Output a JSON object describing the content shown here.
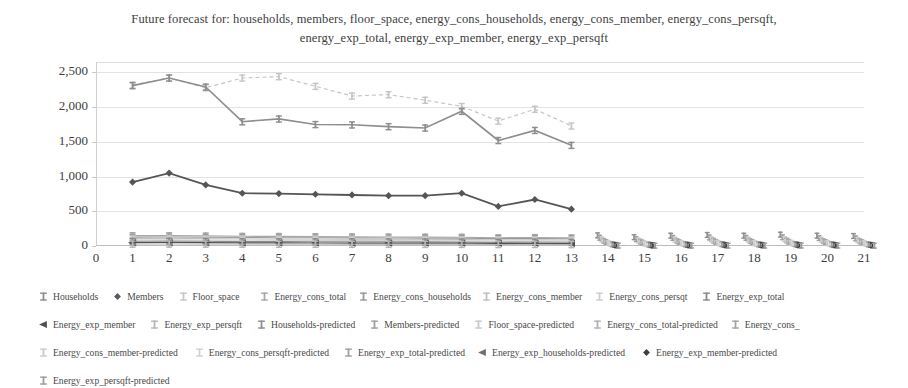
{
  "title": {
    "line1": "Future forecast for: households, members, floor_space, energy_cons_households, energy_cons_member, energy_cons_persqft,",
    "line2": "energy_exp_total, energy_exp_member, energy_exp_persqft"
  },
  "axes": {
    "y_ticks": [
      "0",
      "500",
      "1,000",
      "1,500",
      "2,000",
      "2,500"
    ],
    "x_ticks": [
      "0",
      "1",
      "2",
      "3",
      "4",
      "5",
      "6",
      "7",
      "8",
      "9",
      "10",
      "11",
      "12",
      "13",
      "14",
      "15",
      "16",
      "17",
      "18",
      "19",
      "20",
      "21"
    ]
  },
  "legend": {
    "rows": [
      [
        {
          "label": "Households",
          "marker": "marker-plus",
          "color": "#8e8e8e"
        },
        {
          "label": "Members",
          "marker": "marker-diamond",
          "color": "#5a5a5a"
        },
        {
          "label": "Floor_space",
          "marker": "marker-plus",
          "color": "#c6c6c6"
        },
        {
          "label": "Energy_cons_total",
          "marker": "marker-plus",
          "color": "#a8a8a8"
        },
        {
          "label": "Energy_cons_households",
          "marker": "marker-plus",
          "color": "#9a9a9a"
        },
        {
          "label": "Energy_cons_member",
          "marker": "marker-plus",
          "color": "#bfbfbf"
        },
        {
          "label": "Energy_cons_persqt",
          "marker": "marker-plus",
          "color": "#cfcfcf"
        },
        {
          "label": "Energy_exp_total",
          "marker": "marker-plus",
          "color": "#8a8a8a"
        }
      ],
      [
        {
          "label": "Energy_exp_member",
          "marker": "marker-triangle-left",
          "color": "#4f4f4f"
        },
        {
          "label": "Energy_exp_persqft",
          "marker": "marker-plus",
          "color": "#b5b5b5"
        },
        {
          "label": "Households-predicted",
          "marker": "marker-plus",
          "color": "#8e8e8e"
        },
        {
          "label": "Members-predicted",
          "marker": "marker-plus",
          "color": "#9e9e9e"
        },
        {
          "label": "Floor_space-predicted",
          "marker": "marker-plus",
          "color": "#c9c9c9"
        },
        {
          "label": "Energy_cons_total-predicted",
          "marker": "marker-plus",
          "color": "#b0b0b0"
        },
        {
          "label": "Energy_cons_",
          "marker": "marker-plus",
          "color": "#a4a4a4"
        }
      ],
      [
        {
          "label": "Energy_cons_member-predicted",
          "marker": "marker-plus",
          "color": "#cbcbcb"
        },
        {
          "label": "Energy_cons_persqft-predicted",
          "marker": "marker-plus",
          "color": "#d2d2d2"
        },
        {
          "label": "Energy_exp_total-predicted",
          "marker": "marker-plus",
          "color": "#a0a0a0"
        },
        {
          "label": "Energy_exp_households-predicted",
          "marker": "marker-triangle-left",
          "color": "#6e6e6e"
        },
        {
          "label": "Energy_exp_member-predicted",
          "marker": "marker-diamond",
          "color": "#3f3f3f"
        }
      ],
      [
        {
          "label": "Energy_exp_persqft-predicted",
          "marker": "marker-plus",
          "color": "#9c9c9c"
        }
      ]
    ]
  },
  "chart_data": {
    "type": "line",
    "title": "Future forecast for: households, members, floor_space, energy_cons_households, energy_cons_member, energy_cons_persqft, energy_exp_total, energy_exp_member, energy_exp_persqft",
    "xlabel": "",
    "ylabel": "",
    "xlim": [
      0,
      21
    ],
    "ylim": [
      0,
      2650
    ],
    "grid": true,
    "legend_position": "bottom",
    "x": [
      1,
      2,
      3,
      4,
      5,
      6,
      7,
      8,
      9,
      10,
      11,
      12,
      13
    ],
    "x_predicted": [
      14,
      15,
      16,
      17,
      18,
      19,
      20,
      21
    ],
    "series": [
      {
        "name": "Floor_space",
        "color": "#c6c6c6",
        "dash": "4 3",
        "marker": "plus",
        "width": 1.2,
        "values": [
          2320,
          2420,
          2280,
          2420,
          2440,
          2300,
          2160,
          2180,
          2100,
          2010,
          1800,
          1970,
          1730
        ]
      },
      {
        "name": "Households",
        "color": "#8e8e8e",
        "dash": "none",
        "marker": "plus",
        "width": 1.6,
        "values": [
          2310,
          2420,
          2290,
          1790,
          1830,
          1750,
          1745,
          1720,
          1700,
          1940,
          1520,
          1665,
          1450
        ]
      },
      {
        "name": "Members",
        "color": "#555555",
        "dash": "none",
        "marker": "diamond",
        "width": 1.8,
        "values": [
          920,
          1050,
          880,
          760,
          755,
          745,
          735,
          725,
          725,
          760,
          570,
          670,
          530
        ]
      },
      {
        "name": "Energy_cons_total",
        "color": "#a8a8a8",
        "dash": "none",
        "marker": "plus",
        "width": 1.1,
        "values": [
          150,
          150,
          145,
          140,
          138,
          135,
          132,
          130,
          128,
          126,
          120,
          122,
          118
        ]
      },
      {
        "name": "Energy_cons_households",
        "color": "#9a9a9a",
        "dash": "none",
        "marker": "plus",
        "width": 1.1,
        "values": [
          128,
          130,
          126,
          122,
          120,
          118,
          116,
          115,
          113,
          112,
          106,
          108,
          104
        ]
      },
      {
        "name": "Energy_cons_member",
        "color": "#bfbfbf",
        "dash": "none",
        "marker": "plus",
        "width": 1.0,
        "values": [
          108,
          110,
          106,
          102,
          100,
          99,
          97,
          96,
          95,
          94,
          89,
          91,
          87
        ]
      },
      {
        "name": "Energy_cons_persqt",
        "color": "#cfcfcf",
        "dash": "none",
        "marker": "plus",
        "width": 1.0,
        "values": [
          88,
          90,
          86,
          83,
          82,
          80,
          79,
          78,
          77,
          76,
          72,
          74,
          70
        ]
      },
      {
        "name": "Energy_exp_total",
        "color": "#8a8a8a",
        "dash": "none",
        "marker": "plus",
        "width": 1.1,
        "values": [
          68,
          70,
          67,
          64,
          63,
          62,
          61,
          60,
          59,
          58,
          55,
          57,
          53
        ]
      },
      {
        "name": "Energy_exp_member",
        "color": "#4f4f4f",
        "dash": "none",
        "marker": "triangle-left",
        "width": 1.2,
        "values": [
          48,
          50,
          47,
          45,
          44,
          43,
          42,
          42,
          41,
          40,
          38,
          39,
          36
        ]
      },
      {
        "name": "Energy_exp_persqft",
        "color": "#b5b5b5",
        "dash": "none",
        "marker": "plus",
        "width": 1.0,
        "values": [
          28,
          29,
          28,
          27,
          26,
          26,
          25,
          25,
          24,
          24,
          22,
          23,
          21
        ]
      }
    ],
    "predicted_series": [
      {
        "name": "Households-predicted",
        "color": "#8e8e8e",
        "marker": "plus",
        "values": [
          155,
          128,
          150,
          160,
          150,
          165,
          150,
          145
        ]
      },
      {
        "name": "Members-predicted",
        "color": "#9e9e9e",
        "marker": "plus",
        "values": [
          120,
          100,
          118,
          124,
          118,
          128,
          116,
          112
        ]
      },
      {
        "name": "Floor_space-predicted",
        "color": "#c9c9c9",
        "marker": "plus",
        "values": [
          95,
          80,
          93,
          98,
          94,
          100,
          92,
          88
        ]
      },
      {
        "name": "Energy_cons_total-predicted",
        "color": "#b0b0b0",
        "marker": "plus",
        "values": [
          75,
          62,
          73,
          78,
          74,
          80,
          72,
          70
        ]
      },
      {
        "name": "Energy_cons_households-predicted",
        "color": "#a4a4a4",
        "marker": "plus",
        "values": [
          58,
          48,
          56,
          60,
          57,
          62,
          56,
          54
        ]
      },
      {
        "name": "Energy_cons_member-predicted",
        "color": "#cbcbcb",
        "marker": "plus",
        "values": [
          45,
          37,
          44,
          47,
          44,
          48,
          43,
          42
        ]
      },
      {
        "name": "Energy_cons_persqft-predicted",
        "color": "#d2d2d2",
        "marker": "plus",
        "values": [
          34,
          28,
          33,
          35,
          33,
          36,
          33,
          32
        ]
      },
      {
        "name": "Energy_exp_total-predicted",
        "color": "#a0a0a0",
        "marker": "plus",
        "values": [
          26,
          21,
          25,
          27,
          25,
          28,
          25,
          24
        ]
      },
      {
        "name": "Energy_exp_households-predicted",
        "color": "#6e6e6e",
        "marker": "plus",
        "values": [
          18,
          15,
          18,
          19,
          18,
          20,
          18,
          17
        ]
      },
      {
        "name": "Energy_exp_member-predicted",
        "color": "#3f3f3f",
        "marker": "plus",
        "values": [
          12,
          10,
          12,
          13,
          12,
          13,
          12,
          11
        ]
      },
      {
        "name": "Energy_exp_persqft-predicted",
        "color": "#9c9c9c",
        "marker": "plus",
        "values": [
          7,
          6,
          7,
          7,
          7,
          8,
          7,
          6
        ]
      }
    ]
  }
}
